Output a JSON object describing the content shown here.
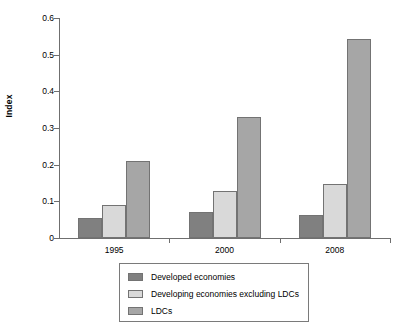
{
  "chart_data": {
    "type": "bar",
    "title": "",
    "subtitle": "",
    "xlabel": "",
    "ylabel": "Index",
    "categories": [
      "1995",
      "2000",
      "2008"
    ],
    "series": [
      {
        "name": "Developed economies",
        "color": "#808080",
        "values": [
          0.055,
          0.072,
          0.063
        ]
      },
      {
        "name": "Developing economies excluding LDCs",
        "color": "#d9d9d9",
        "values": [
          0.09,
          0.127,
          0.148
        ]
      },
      {
        "name": "LDCs",
        "color": "#a6a6a6",
        "values": [
          0.21,
          0.33,
          0.543
        ]
      }
    ],
    "ylim": [
      0,
      0.6
    ],
    "ytick_values": [
      0,
      0.1,
      0.2,
      0.3,
      0.4,
      0.5,
      0.6
    ],
    "ytick_labels": [
      "0",
      "0.1",
      "0.2",
      "0.3",
      "0.4",
      "0.5",
      "0.6"
    ],
    "grid": false,
    "legend_position": "bottom"
  },
  "axes": {
    "y_title": "Index"
  },
  "legend": {
    "items": [
      {
        "label": "Developed economies",
        "color": "#808080"
      },
      {
        "label": "Developing economies excluding LDCs",
        "color": "#d9d9d9"
      },
      {
        "label": "LDCs",
        "color": "#a6a6a6"
      }
    ]
  }
}
